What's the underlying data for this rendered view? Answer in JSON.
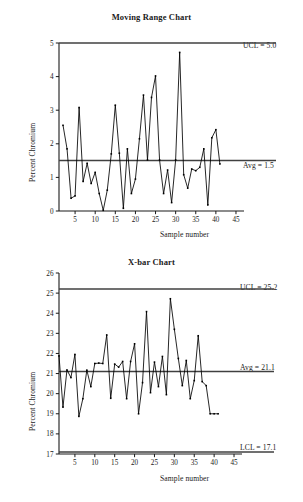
{
  "page": {
    "background": "#ffffff",
    "ink": "#1a1a1a",
    "line_color": "#000000",
    "limit_color": "#404040"
  },
  "charts": [
    {
      "id": "moving-range",
      "title": "Moving Range Chart",
      "xlabel": "Sample number",
      "ylabel": "Percent Chromium",
      "ucl_label": "UCL = 5.0",
      "avg_label": "Avg = 1.5",
      "lcl_label": ""
    },
    {
      "id": "x-bar",
      "title": "X-bar Chart",
      "xlabel": "Sample number",
      "ylabel": "Percent Chromium",
      "ucl_label": "UCL = 25.2",
      "avg_label": "Avg = 21.1",
      "lcl_label": "LCL = 17.1"
    }
  ],
  "chart_data": [
    {
      "type": "line",
      "id": "moving-range",
      "title": "Moving Range Chart",
      "xlabel": "Sample number",
      "ylabel": "Percent Chromium",
      "xlim": [
        1,
        46
      ],
      "ylim": [
        0,
        5
      ],
      "xticks": [
        5,
        10,
        15,
        20,
        25,
        30,
        35,
        40,
        45
      ],
      "yticks": [
        0,
        1,
        2,
        3,
        4,
        5
      ],
      "grid": false,
      "legend": "none",
      "markers": true,
      "control_limits": [
        {
          "name": "UCL",
          "value": 5.0,
          "label": "UCL = 5.0"
        },
        {
          "name": "Avg",
          "value": 1.5,
          "label": "Avg = 1.5"
        }
      ],
      "x": [
        2,
        3,
        4,
        5,
        6,
        7,
        8,
        9,
        10,
        11,
        12,
        13,
        14,
        15,
        16,
        17,
        18,
        19,
        20,
        21,
        22,
        23,
        24,
        25,
        26,
        27,
        28,
        29,
        30,
        31,
        32,
        33,
        34,
        35,
        36,
        37,
        38,
        39,
        40,
        41
      ],
      "values": [
        2.55,
        1.85,
        0.38,
        0.45,
        3.08,
        0.88,
        1.42,
        0.82,
        1.15,
        0.52,
        0.02,
        0.62,
        1.7,
        3.15,
        1.72,
        0.08,
        1.85,
        0.52,
        0.95,
        2.15,
        3.45,
        1.52,
        3.38,
        4.02,
        1.52,
        0.52,
        1.22,
        0.25,
        1.52,
        4.72,
        1.08,
        0.68,
        1.25,
        1.2,
        1.3,
        1.85,
        0.18,
        2.18,
        2.42,
        1.4
      ],
      "series_name": "Moving range"
    },
    {
      "type": "line",
      "id": "x-bar",
      "title": "X-bar Chart",
      "xlabel": "Sample number",
      "ylabel": "Percent Chromium",
      "xlim": [
        1,
        46
      ],
      "ylim": [
        17,
        26
      ],
      "xticks": [
        5,
        10,
        15,
        20,
        25,
        30,
        35,
        40,
        45
      ],
      "yticks": [
        17,
        18,
        19,
        20,
        21,
        22,
        23,
        24,
        25,
        26
      ],
      "grid": false,
      "legend": "none",
      "markers": true,
      "control_limits": [
        {
          "name": "UCL",
          "value": 25.2,
          "label": "UCL = 25.2"
        },
        {
          "name": "Avg",
          "value": 21.1,
          "label": "Avg = 21.1"
        },
        {
          "name": "LCL",
          "value": 17.1,
          "label": "LCL = 17.1"
        }
      ],
      "x": [
        1,
        2,
        3,
        4,
        5,
        6,
        7,
        8,
        9,
        10,
        11,
        12,
        13,
        14,
        15,
        16,
        17,
        18,
        19,
        20,
        21,
        22,
        23,
        24,
        25,
        26,
        27,
        28,
        29,
        30,
        31,
        32,
        33,
        34,
        35,
        36,
        37,
        38,
        39,
        40,
        41
      ],
      "values": [
        21.88,
        19.33,
        21.18,
        20.8,
        21.95,
        18.87,
        19.75,
        21.17,
        20.35,
        21.5,
        21.52,
        21.5,
        22.92,
        19.77,
        21.47,
        21.32,
        21.6,
        19.75,
        21.6,
        22.48,
        19.0,
        20.55,
        24.08,
        20.05,
        21.57,
        20.35,
        21.85,
        19.95,
        24.72,
        23.2,
        21.75,
        20.4,
        21.65,
        19.75,
        20.65,
        22.88,
        20.6,
        20.4,
        19.0,
        19.0,
        19.0
      ],
      "series_name": "X-bar"
    }
  ]
}
